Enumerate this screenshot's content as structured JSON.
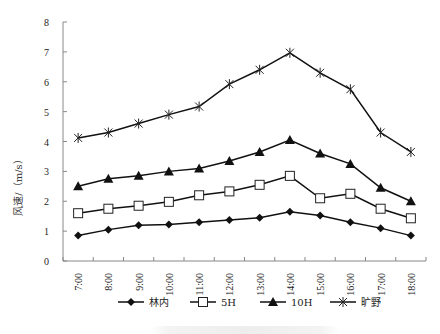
{
  "chart_data": {
    "type": "line",
    "title": "",
    "xlabel": "",
    "ylabel": "风速/（m/s）",
    "ylim": [
      0,
      8
    ],
    "yticks": [
      0,
      1,
      2,
      3,
      4,
      5,
      6,
      7,
      8
    ],
    "grid": false,
    "legend_position": "bottom",
    "categories": [
      "7:00",
      "8:00",
      "9:00",
      "10:00",
      "11:00",
      "12:00",
      "13:00",
      "14:00",
      "15:00",
      "16:00",
      "17:00",
      "18:00"
    ],
    "series": [
      {
        "name": "林内",
        "marker": "diamond-filled",
        "values": [
          0.85,
          1.05,
          1.2,
          1.22,
          1.3,
          1.37,
          1.45,
          1.65,
          1.52,
          1.3,
          1.1,
          0.85
        ]
      },
      {
        "name": "5H",
        "marker": "square-open",
        "values": [
          1.6,
          1.75,
          1.85,
          1.98,
          2.2,
          2.33,
          2.55,
          2.85,
          2.1,
          2.25,
          1.75,
          1.43
        ]
      },
      {
        "name": "10H",
        "marker": "triangle-filled",
        "values": [
          2.5,
          2.75,
          2.85,
          3.0,
          3.1,
          3.35,
          3.65,
          4.05,
          3.6,
          3.25,
          2.45,
          2.0
        ]
      },
      {
        "name": "旷野",
        "marker": "asterisk",
        "values": [
          4.12,
          4.3,
          4.6,
          4.9,
          5.17,
          5.92,
          6.4,
          6.97,
          6.3,
          5.75,
          4.3,
          3.65
        ]
      }
    ]
  }
}
